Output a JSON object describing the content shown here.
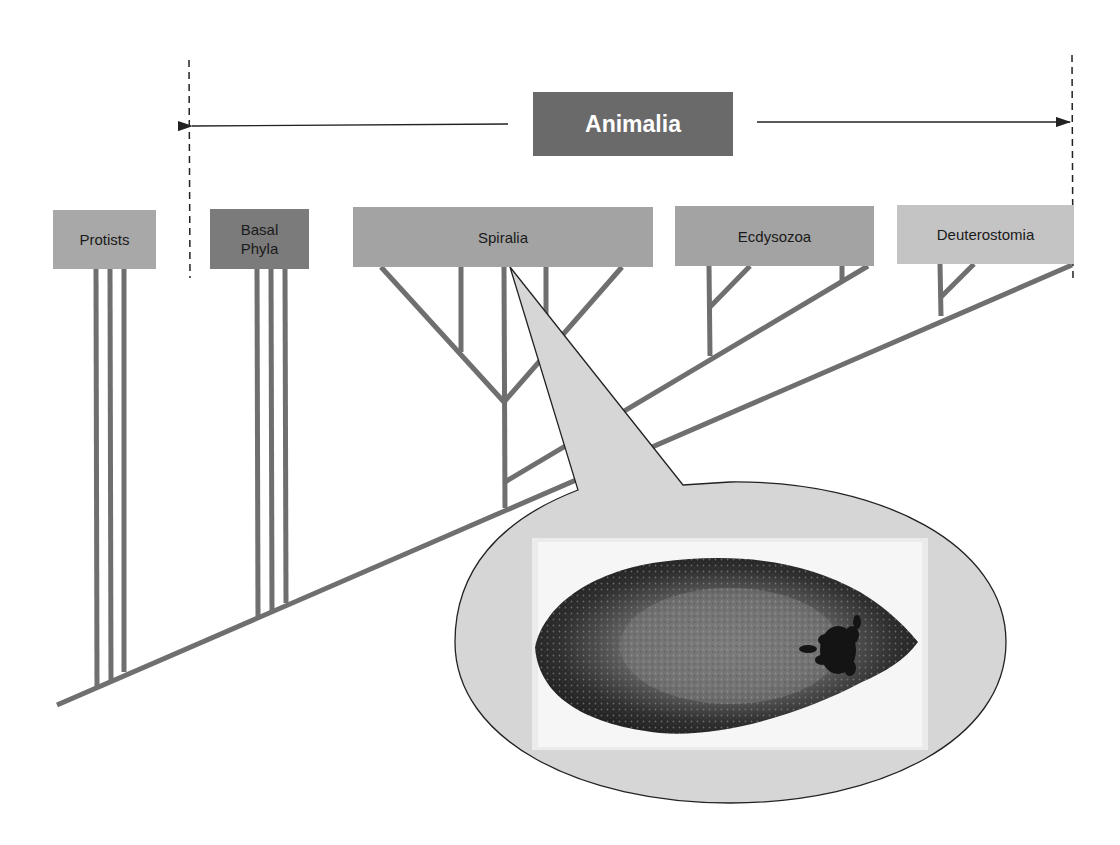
{
  "title": {
    "label": "Animalia",
    "color": "#6a6a6a",
    "text_color": "#ffffff"
  },
  "clades": [
    {
      "id": "protists",
      "label": "Protists",
      "color": "#a8a8a8",
      "x": 53,
      "y": 210,
      "w": 103,
      "h": 59
    },
    {
      "id": "basal-phyla",
      "label": "Basal Phyla",
      "line1": "Basal",
      "line2": "Phyla",
      "color": "#7b7b7b",
      "x": 210,
      "y": 209,
      "w": 99,
      "h": 60
    },
    {
      "id": "spiralia",
      "label": "Spiralia",
      "color": "#a3a3a3",
      "x": 353,
      "y": 207,
      "w": 300,
      "h": 60
    },
    {
      "id": "ecdysozoa",
      "label": "Ecdysozoa",
      "color": "#a3a3a3",
      "x": 675,
      "y": 206,
      "w": 199,
      "h": 60
    },
    {
      "id": "deuterostomia",
      "label": "Deuterostomia",
      "color": "#c4c4c4",
      "x": 897,
      "y": 205,
      "w": 177,
      "h": 59
    }
  ],
  "colors": {
    "branch": "#6f6f6f",
    "callout_fill": "#d6d6d6",
    "callout_stroke": "#222222",
    "dashed": "#222222"
  },
  "callout": {
    "points_to": "Spiralia",
    "image_subject": "flatworm specimen (stained)"
  }
}
